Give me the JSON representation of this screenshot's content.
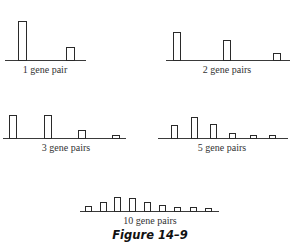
{
  "figure_caption": "Figure 14–9",
  "chart_data": [
    {
      "type": "bar",
      "title": "1 gene pair",
      "categories": [
        "class 1",
        "class 2"
      ],
      "values": [
        1.0,
        0.33
      ],
      "xlabel": "1 gene pair",
      "ylabel": "",
      "grid": false
    },
    {
      "type": "bar",
      "title": "2 gene pairs",
      "categories": [
        "class 1",
        "class 2",
        "class 3"
      ],
      "values": [
        0.71,
        0.51,
        0.18
      ],
      "xlabel": "2 gene pairs",
      "ylabel": "",
      "grid": false
    },
    {
      "type": "bar",
      "title": "3 gene pairs",
      "categories": [
        "class 1",
        "class 2",
        "class 3",
        "class 4"
      ],
      "values": [
        0.59,
        0.59,
        0.21,
        0.05
      ],
      "xlabel": "3 gene pairs",
      "ylabel": "",
      "grid": false
    },
    {
      "type": "bar",
      "title": "5 gene pairs",
      "categories": [
        "class 1",
        "class 2",
        "class 3",
        "class 4",
        "class 5",
        "class 6"
      ],
      "values": [
        0.33,
        0.54,
        0.36,
        0.13,
        0.08,
        0.06
      ],
      "xlabel": "5 gene pairs",
      "ylabel": "",
      "grid": false
    },
    {
      "type": "bar",
      "title": "10 gene pairs",
      "categories": [
        "class 1",
        "class 2",
        "class 3",
        "class 4",
        "class 5",
        "class 6",
        "class 7",
        "class 8",
        "class 9"
      ],
      "values": [
        0.13,
        0.23,
        0.36,
        0.33,
        0.23,
        0.15,
        0.11,
        0.11,
        0.08
      ],
      "xlabel": "10 gene pairs",
      "ylabel": "",
      "grid": false
    }
  ]
}
